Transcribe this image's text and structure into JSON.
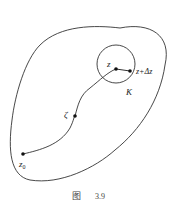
{
  "figure": {
    "caption_prefix": "图",
    "caption_number": "3.9"
  },
  "labels": {
    "z": "z",
    "z_delta": "z+Δz",
    "K": "K",
    "zeta": "ζ",
    "z0_base": "z",
    "z0_sub": "0"
  },
  "colors": {
    "stroke": "#333333",
    "text": "#222222",
    "background": "#ffffff"
  }
}
